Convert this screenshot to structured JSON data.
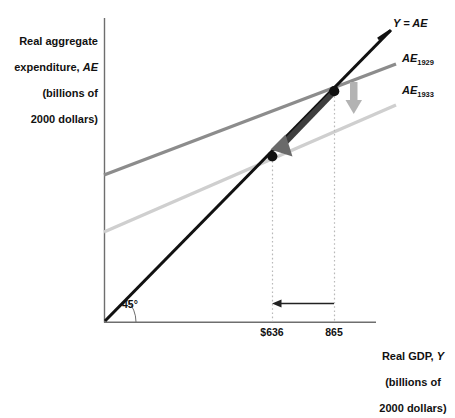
{
  "figure": {
    "y_axis_title": "Real aggregate\nexpenditure, AE\n(billions of\n2000 dollars)",
    "y_axis_title_lines": [
      "Real aggregate",
      "expenditure, AE",
      "(billions of",
      "2000 dollars)"
    ],
    "x_axis_title": "Real GDP, Y\n(billions of\n2000 dollars)",
    "x_axis_title_lines": [
      "Real GDP, Y",
      "(billions of",
      "2000 dollars)"
    ],
    "angle_label": "45°",
    "labels": {
      "line45": "Y = AE",
      "ae1929_main": "AE",
      "ae1929_sub": "1929",
      "ae1933_main": "AE",
      "ae1933_sub": "1933"
    },
    "tick_labels": {
      "x1": "$636",
      "x2": "865"
    },
    "colors": {
      "line45": "#111111",
      "ae1929": "#8c8c8c",
      "ae1933": "#cfcfcf",
      "axis": "#6e6e6e",
      "dot": "#111111",
      "shift_arrow": "#b3b3b3",
      "adjust_arrow": "#4a4a4a",
      "gdp_arrow": "#222222",
      "dotted": "#b9b9b9"
    }
  },
  "chart_data": {
    "type": "line",
    "title": "",
    "subtitle": "",
    "xlabel": "Real GDP, Y (billions of 2000 dollars)",
    "ylabel": "Real aggregate expenditure, AE (billions of 2000 dollars)",
    "xlim": [
      0,
      1100
    ],
    "ylim": [
      0,
      1100
    ],
    "grid": false,
    "legend_position": "right-of-lines",
    "series": [
      {
        "name": "Y = AE",
        "kind": "45-degree line",
        "color": "#111111",
        "x": [
          0,
          1080
        ],
        "y": [
          0,
          1080
        ]
      },
      {
        "name": "AE_1929",
        "kind": "aggregate expenditure 1929",
        "color": "#8c8c8c",
        "x": [
          0,
          1080
        ],
        "y": [
          340,
          1000
        ]
      },
      {
        "name": "AE_1933",
        "kind": "aggregate expenditure 1933",
        "color": "#cfcfcf",
        "x": [
          0,
          1080
        ],
        "y": [
          180,
          840
        ]
      }
    ],
    "equilibria": [
      {
        "label": "1929 equilibrium",
        "x": 865,
        "y": 865,
        "marker": "filled-circle"
      },
      {
        "label": "1933 equilibrium",
        "x": 636,
        "y": 636,
        "marker": "filled-circle"
      }
    ],
    "xticks": [
      636,
      865
    ],
    "xtick_labels": [
      "$636",
      "865"
    ],
    "annotations": [
      {
        "type": "arrow",
        "name": "ae-downward-shift",
        "direction": "down",
        "color": "#b3b3b3",
        "note": "AE curve shifts down from AE_1929 to AE_1933"
      },
      {
        "type": "arrow",
        "name": "equilibrium-adjustment",
        "direction": "down-left",
        "color": "#4a4a4a",
        "note": "movement from 1929 equilibrium to 1933 equilibrium"
      },
      {
        "type": "arrow",
        "name": "real-gdp-decline",
        "direction": "left",
        "color": "#222222",
        "note": "real GDP falls from 865 to $636"
      }
    ]
  }
}
